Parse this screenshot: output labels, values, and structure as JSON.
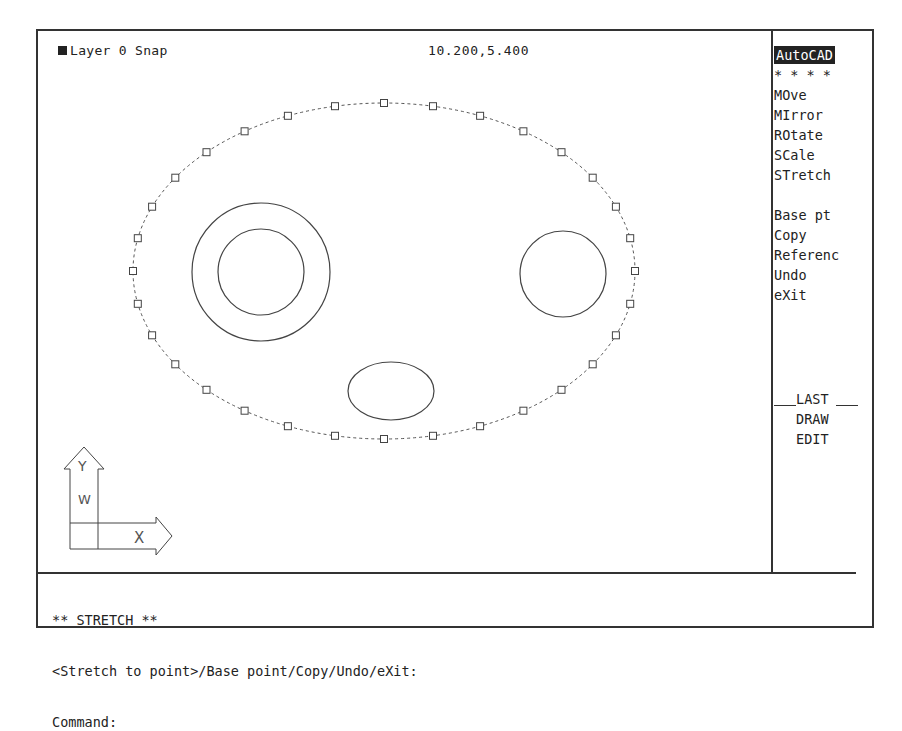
{
  "status_bar": {
    "layer_label": "Layer 0 Snap",
    "coordinates": "10.200,5.400"
  },
  "screen_menu": {
    "title": "AutoCAD",
    "separator": "* * * *",
    "items": [
      {
        "label": "MOve"
      },
      {
        "label": "MIrror"
      },
      {
        "label": "ROtate"
      },
      {
        "label": "SCale"
      },
      {
        "label": "STretch"
      }
    ],
    "options": [
      {
        "label": "Base pt"
      },
      {
        "label": "Copy"
      },
      {
        "label": "Referenc"
      },
      {
        "label": "Undo"
      },
      {
        "label": "eXit"
      }
    ],
    "footer": [
      {
        "label": "LAST"
      },
      {
        "label": "DRAW"
      },
      {
        "label": "EDIT"
      }
    ]
  },
  "command_area": {
    "lines": [
      "** STRETCH **",
      "<Stretch to point>/Base point/Copy/Undo/eXit:",
      "Command:"
    ]
  },
  "ucs_icon": {
    "y_label": "Y",
    "w_label": "W",
    "x_label": "X"
  },
  "drawing": {
    "outline_ellipse": {
      "cx": 346,
      "cy": 240,
      "rx": 251,
      "ry": 168,
      "grips": 32,
      "style": "dashed"
    },
    "circles": [
      {
        "name": "left-outer-circle",
        "cx": 223,
        "cy": 241,
        "r": 69
      },
      {
        "name": "left-inner-circle",
        "cx": 223,
        "cy": 241,
        "r": 43
      },
      {
        "name": "right-circle",
        "cx": 525,
        "cy": 243,
        "r": 43
      }
    ],
    "ellipses": [
      {
        "name": "bottom-ellipse",
        "cx": 353,
        "cy": 360,
        "rx": 43,
        "ry": 29
      }
    ]
  }
}
